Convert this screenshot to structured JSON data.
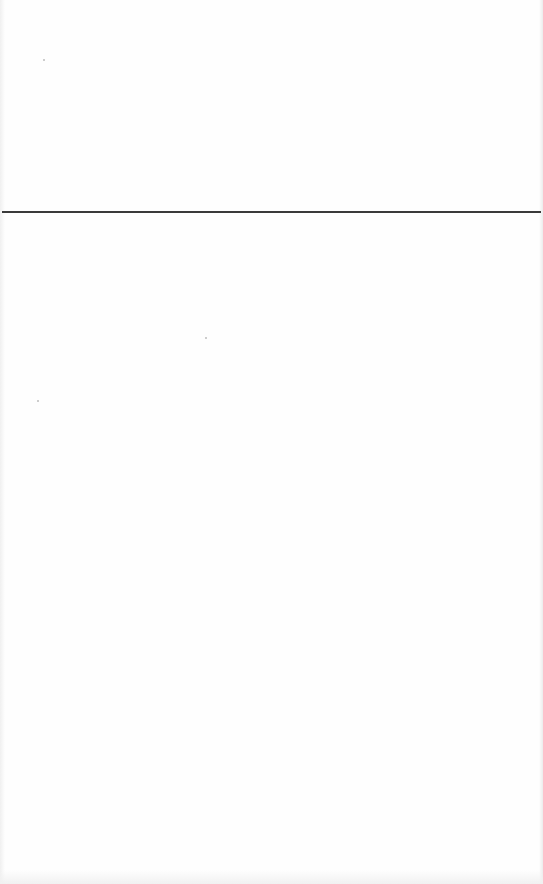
{
  "document": {
    "background_color": "#fefefe",
    "rule": {
      "color": "#3a3a3a",
      "y": 212,
      "thickness": 2
    },
    "text_content": ""
  }
}
